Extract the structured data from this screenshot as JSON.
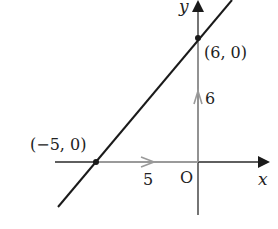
{
  "diagram": {
    "axes": {
      "x_label": "x",
      "y_label": "y",
      "origin_label": "O"
    },
    "points": [
      {
        "label": "(−5, 0)",
        "x": -5,
        "y": 0
      },
      {
        "label": "(6, 0)",
        "x": 0,
        "y": 6
      }
    ],
    "displacements": [
      {
        "label": "5",
        "direction": "horizontal"
      },
      {
        "label": "6",
        "direction": "vertical"
      }
    ],
    "colors": {
      "line": "#1a1a1a",
      "axis": "#2a2a2a",
      "arrow": "#9a9a9a",
      "text": "#222222"
    }
  }
}
